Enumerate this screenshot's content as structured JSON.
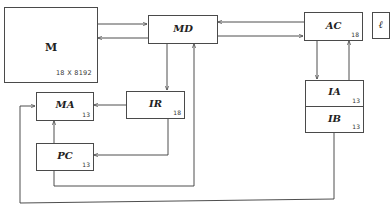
{
  "diagram": {
    "type": "block-diagram",
    "blocks": {
      "M": {
        "label": "M",
        "caption": "18 X 8192"
      },
      "MD": {
        "label": "MD"
      },
      "AC": {
        "label": "AC",
        "width": "18"
      },
      "L": {
        "label": "ℓ"
      },
      "MA": {
        "label": "MA",
        "width": "13"
      },
      "IR": {
        "label": "IR",
        "width": "18"
      },
      "PC": {
        "label": "PC",
        "width": "13"
      },
      "IA": {
        "label": "IA",
        "width": "13"
      },
      "IB": {
        "label": "IB",
        "width": "13"
      }
    },
    "connections": [
      {
        "from": "M",
        "to": "MD"
      },
      {
        "from": "MD",
        "to": "M"
      },
      {
        "from": "MD",
        "to": "AC"
      },
      {
        "from": "AC",
        "to": "MD"
      },
      {
        "from": "MD",
        "to": "IR"
      },
      {
        "from": "IR",
        "to": "MA"
      },
      {
        "from": "IR",
        "to": "PC"
      },
      {
        "from": "PC",
        "to": "MA"
      },
      {
        "from": "PC",
        "to": "MD"
      },
      {
        "from": "AC",
        "to": "IA"
      },
      {
        "from": "IA",
        "to": "AC"
      },
      {
        "from": "IB",
        "to": "MA"
      }
    ],
    "colors": {
      "line": "#3a3a3a",
      "text": "#222222",
      "background": "#ffffff"
    }
  }
}
